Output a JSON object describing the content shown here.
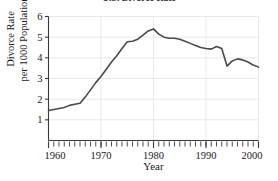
{
  "chart_data": {
    "type": "line",
    "title": "U.S. Divorce Rate",
    "xlabel": "Year",
    "ylabel_line1": "Divorce Rate",
    "ylabel_line2": "per 1000 Population",
    "xlim": [
      1960,
      2000
    ],
    "ylim": [
      0,
      6
    ],
    "yticks": [
      1,
      2,
      3,
      4,
      5,
      6
    ],
    "ytick_labels": [
      "1",
      "2",
      "3",
      "4",
      "5",
      "6"
    ],
    "xticks": [
      1960,
      1970,
      1980,
      1990,
      2000
    ],
    "xtick_labels": [
      "1960",
      "1970",
      "1980",
      "1990",
      "2000"
    ],
    "minor_xtick_step": 1,
    "grid": "light gray horizontal at integers and vertical at decades",
    "legend": null,
    "line_color": "#4a4a4a",
    "line_width": 1.6,
    "x": [
      1960,
      1961,
      1962,
      1963,
      1964,
      1965,
      1966,
      1967,
      1968,
      1969,
      1970,
      1971,
      1972,
      1973,
      1974,
      1975,
      1976,
      1977,
      1978,
      1979,
      1980,
      1981,
      1982,
      1983,
      1984,
      1985,
      1986,
      1987,
      1988,
      1989,
      1990,
      1991,
      1992,
      1993,
      1994,
      1995,
      1996,
      1997,
      1998,
      1999,
      2000
    ],
    "values": [
      1.45,
      1.5,
      1.55,
      1.6,
      1.7,
      1.75,
      1.8,
      2.1,
      2.45,
      2.8,
      3.1,
      3.45,
      3.8,
      4.1,
      4.45,
      4.78,
      4.8,
      4.9,
      5.1,
      5.3,
      5.4,
      5.15,
      5.0,
      4.95,
      4.95,
      4.9,
      4.8,
      4.7,
      4.6,
      4.5,
      4.45,
      4.42,
      4.55,
      4.45,
      3.6,
      3.85,
      3.95,
      3.9,
      3.8,
      3.65,
      3.55
    ],
    "series": [
      {
        "name": "U.S. Divorce Rate",
        "values": [
          1.45,
          1.5,
          1.55,
          1.6,
          1.7,
          1.75,
          1.8,
          2.1,
          2.45,
          2.8,
          3.1,
          3.45,
          3.8,
          4.1,
          4.45,
          4.78,
          4.8,
          4.9,
          5.1,
          5.3,
          5.4,
          5.15,
          5.0,
          4.95,
          4.95,
          4.9,
          4.8,
          4.7,
          4.6,
          4.5,
          4.45,
          4.42,
          4.55,
          4.45,
          3.6,
          3.85,
          3.95,
          3.9,
          3.8,
          3.65,
          3.55
        ]
      }
    ]
  },
  "colors": {
    "line": "#4a4a4a",
    "axis": "#3a3a3a",
    "grid": "#e9e9e9",
    "text": "#1a1a1a",
    "background": "#ffffff"
  }
}
